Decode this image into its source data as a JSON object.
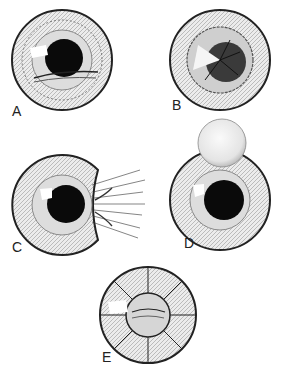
{
  "figure": {
    "panels": [
      {
        "id": "A",
        "label": "A",
        "description": "iris with peripheral notch and horizontal lower fold"
      },
      {
        "id": "B",
        "label": "B",
        "description": "iris with sector defect and dark radial pupil"
      },
      {
        "id": "C",
        "label": "C",
        "description": "iris with notch and radiating fibers/strands to right"
      },
      {
        "id": "D",
        "label": "D",
        "description": "iris with notch and round bubble at top"
      },
      {
        "id": "E",
        "label": "E",
        "description": "iris divided by radial lines with central lens-like opacity"
      }
    ],
    "colors": {
      "ink": "#1a1a1a",
      "background": "#ffffff",
      "iris_fill": "#e9e9e9"
    }
  }
}
